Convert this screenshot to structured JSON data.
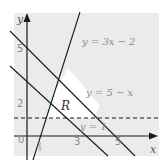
{
  "diagram": {
    "type": "linear-inequality-region",
    "axes": {
      "x_label": "x",
      "y_label": "y",
      "origin_label": "0"
    },
    "x_ticks": [
      "2/3",
      "3",
      "5"
    ],
    "y_ticks": [
      "2",
      "5"
    ],
    "lines": [
      {
        "label": "y = 3x − 2",
        "style": "solid"
      },
      {
        "label": "y = 5 − x",
        "style": "solid"
      },
      {
        "label": "y = 1",
        "style": "dashed"
      },
      {
        "label": "",
        "style": "solid",
        "equation": "y = 3 − x"
      }
    ],
    "region_label": "R",
    "colors": {
      "background": "#ebebeb",
      "region": "#ffffff",
      "line": "#1a1a1a",
      "text": "#8a8a8a"
    }
  }
}
